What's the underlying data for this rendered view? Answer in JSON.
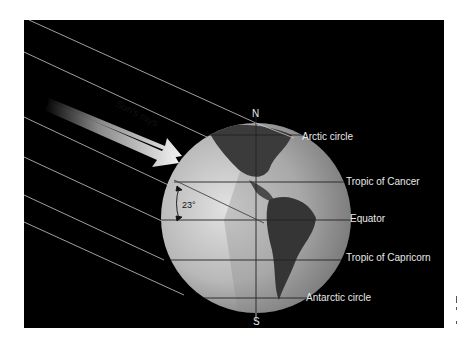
{
  "diagram": {
    "arrow_label": "Sun's rays",
    "poles": {
      "north": "N",
      "south": "S"
    },
    "angle_label": "23°",
    "latitude_labels": [
      {
        "name": "arctic",
        "text": "Arctic circle"
      },
      {
        "name": "tropic-cancer",
        "text": "Tropic of Cancer"
      },
      {
        "name": "equator",
        "text": "Equator"
      },
      {
        "name": "tropic-capricorn",
        "text": "Tropic of Capricorn"
      },
      {
        "name": "antarctic",
        "text": "Antarctic circle"
      }
    ],
    "colors": {
      "background": "#000000",
      "labels": "#e8e8e8",
      "rays": "#c8c8c8",
      "globe_light": "#c9c9c9",
      "globe_dark": "#3a3a3a"
    }
  }
}
